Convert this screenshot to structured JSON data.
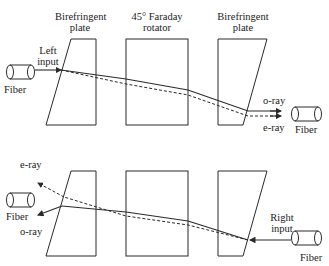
{
  "labels": {
    "plate_left": "Birefringent plate",
    "plate_left_l1": "Birefringent",
    "plate_left_l2": "plate",
    "rotator_l1": "45° Faraday",
    "rotator_l2": "rotator",
    "plate_right_l1": "Birefringent",
    "plate_right_l2": "plate",
    "left_input_l1": "Left",
    "left_input_l2": "input",
    "fiber_top_left": "Fiber",
    "o_ray_top": "o-ray",
    "e_ray_top": "e-ray",
    "fiber_top_right": "Fiber",
    "e_ray_bottom": "e-ray",
    "fiber_bottom_left": "Fiber",
    "o_ray_bottom": "o-ray",
    "right_input_l1": "Right",
    "right_input_l2": "input",
    "fiber_bottom_right": "Fiber"
  },
  "colors": {
    "line": "#2a2a2a",
    "background": "#ffffff"
  }
}
